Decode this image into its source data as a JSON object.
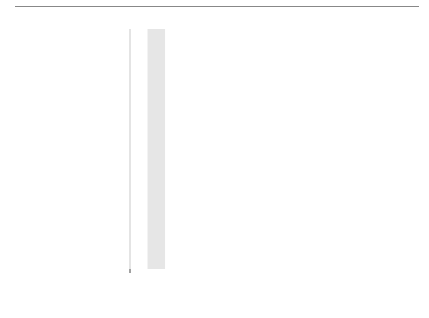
{
  "chart_data": {
    "type": "line",
    "title": "",
    "xlabel": "Mass number",
    "ylabel": "Binding energy per nucleon in MeV",
    "xlim": [
      0,
      245
    ],
    "ylim": [
      0,
      8.8
    ],
    "xticks": [
      50,
      100,
      150,
      200
    ],
    "yticks": [
      2,
      4,
      6,
      8
    ],
    "grid": true,
    "series": [
      {
        "name": "Binding energy curve",
        "x": [
          2,
          3,
          4,
          6,
          12,
          16,
          20,
          30,
          56,
          62,
          90,
          139,
          180,
          235
        ],
        "y": [
          1.1,
          2.6,
          7.1,
          5.3,
          7.7,
          8.0,
          8.0,
          8.5,
          8.8,
          8.8,
          8.7,
          8.4,
          8.0,
          7.6
        ]
      }
    ],
    "points": [
      {
        "label": "H",
        "mass": 2,
        "z": 1,
        "y": 1.1
      },
      {
        "label": "He",
        "mass": 3,
        "z": 2,
        "y": 2.6
      },
      {
        "label": "He",
        "mass": 4,
        "z": 2,
        "y": 7.1
      },
      {
        "label": "Li",
        "mass": 6,
        "z": 3,
        "y": 5.6
      },
      {
        "label": "C",
        "mass": 12,
        "z": 6,
        "y": 7.7
      },
      {
        "label": "Fe",
        "mass": 56,
        "z": 26,
        "y": 8.8
      },
      {
        "label": "Ba",
        "mass": 139,
        "z": 56,
        "y": 8.4
      },
      {
        "label": "U",
        "mass": 235,
        "z": 92,
        "y": 7.6
      }
    ],
    "annotations": {
      "fusion": "Fusion",
      "fission": "Fission",
      "stable_band": [
        62,
        74
      ],
      "stable_label": [
        "Most",
        "stable",
        "nuclides"
      ]
    }
  }
}
